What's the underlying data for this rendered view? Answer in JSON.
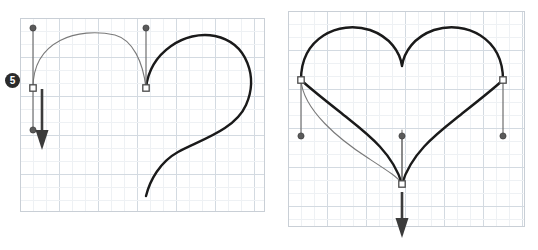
{
  "figure": {
    "background": "#ffffff",
    "width": 538,
    "height": 250
  },
  "colors": {
    "panel_border": "#c9cfd6",
    "grid_minor": "#eef1f4",
    "grid_major": "#d3dae1",
    "stroke_active": "#1a1a1a",
    "stroke_preview": "#7a7a7a",
    "handle_line": "#6e6e6e",
    "handle_dot_fill": "#5a5a5a",
    "anchor_fill": "#ffffff",
    "anchor_stroke": "#4a4a4a",
    "arrow": "#3b3b3b",
    "badge_bg": "#2b2b2b",
    "badge_text": "#ffffff"
  },
  "panels": [
    {
      "name": "left-panel",
      "label": "Step 5 — drag the handle downward",
      "x": 20,
      "y": 18,
      "width": 245,
      "height": 194,
      "grid": {
        "minor_spacing": 13,
        "major_spacing": 39,
        "visible": true
      },
      "badge": {
        "label": "5",
        "x": 5,
        "y": 73
      },
      "paths": {
        "preview": "M 33,88 C 33,40 78,27 115,35 C 133,40 143,62 146,88",
        "active": "M 146,88 C 150,52 185,30 215,36 C 248,43 258,78 246,105 C 235,130 200,140 178,152 C 160,162 150,180 146,196"
      },
      "anchors": [
        {
          "name": "anchor-left",
          "x": 33,
          "y": 88,
          "type": "square"
        },
        {
          "name": "anchor-center",
          "x": 146,
          "y": 88,
          "type": "square"
        }
      ],
      "handles": [
        {
          "name": "handle-left-up",
          "ax": 33,
          "ay": 88,
          "hx": 33,
          "hy": 28
        },
        {
          "name": "handle-center-up",
          "ax": 146,
          "ay": 88,
          "hx": 146,
          "hy": 28
        },
        {
          "name": "handle-left-down",
          "ax": 33,
          "ay": 88,
          "hx": 33,
          "hy": 130
        }
      ],
      "arrow": {
        "name": "drag-arrow-down",
        "x1": 42,
        "y1": 89,
        "x2": 42,
        "y2": 150,
        "head_width": 13,
        "head_length": 20
      }
    },
    {
      "name": "right-panel",
      "label": "Completed symmetric heart with handles",
      "x": 288,
      "y": 11,
      "width": 237,
      "height": 216,
      "grid": {
        "minor_spacing": 13,
        "major_spacing": 39,
        "visible": true
      },
      "badge": null,
      "paths": {
        "active": "M 402,184 C 392,150 362,130 340,112 C 312,90 301,80 301,80 C 301,38 338,20 370,30 C 390,37 400,52 402,66 C 404,52 414,37 434,30 C 466,20 503,38 503,80 C 503,80 492,90 464,112 C 442,130 412,150 402,184",
        "preview": "M 301,80 C 303,110 340,140 368,158 C 388,171 399,178 402,184 C 402,178 402,150 402,130"
      },
      "anchors": [
        {
          "name": "anchor-left",
          "x": 301,
          "y": 80,
          "type": "square"
        },
        {
          "name": "anchor-right",
          "x": 503,
          "y": 80,
          "type": "square"
        },
        {
          "name": "anchor-bottom",
          "x": 402,
          "y": 184,
          "type": "square"
        }
      ],
      "handles": [
        {
          "name": "handle-left-down",
          "ax": 301,
          "ay": 80,
          "hx": 301,
          "hy": 136
        },
        {
          "name": "handle-right-down",
          "ax": 503,
          "ay": 80,
          "hx": 503,
          "hy": 136
        },
        {
          "name": "handle-bottom-up",
          "ax": 402,
          "ay": 184,
          "hx": 402,
          "hy": 136
        }
      ],
      "arrow": {
        "name": "drag-arrow-down",
        "x1": 402,
        "y1": 192,
        "x2": 402,
        "y2": 238,
        "head_width": 13,
        "head_length": 20
      }
    }
  ]
}
